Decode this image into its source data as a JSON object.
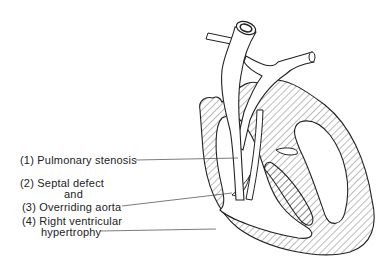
{
  "diagram": {
    "labels": [
      {
        "id": "pulmonary-stenosis",
        "number": "(1)",
        "text": "Pulmonary stenosis"
      },
      {
        "id": "septal-defect",
        "number": "(2)",
        "text": "Septal defect"
      },
      {
        "id": "and",
        "number": "",
        "text": "and"
      },
      {
        "id": "overriding-aorta",
        "number": "(3)",
        "text": "Overriding aorta"
      },
      {
        "id": "rv-hypertrophy",
        "number": "(4)",
        "text": "Right ventricular"
      },
      {
        "id": "rv-hypertrophy-2",
        "number": "",
        "text": "hypertrophy"
      }
    ],
    "colors": {
      "line": "#222222",
      "hatch": "#555555",
      "background": "#ffffff"
    }
  }
}
